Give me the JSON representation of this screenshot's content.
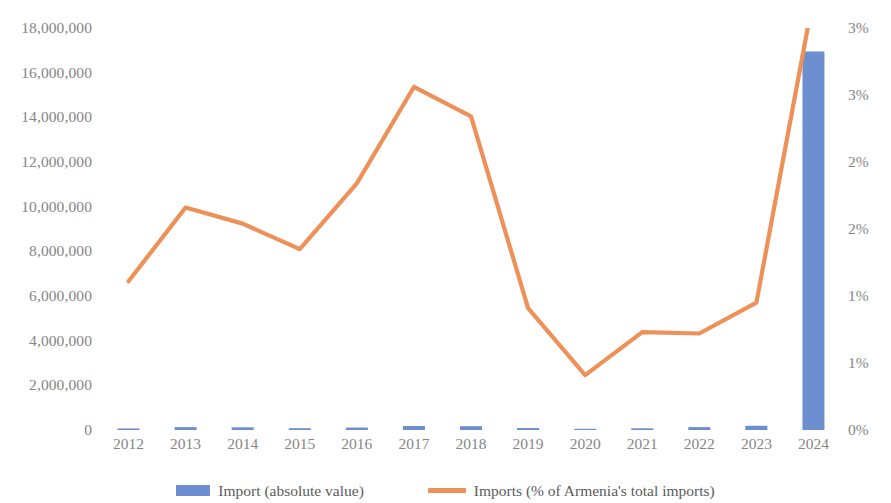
{
  "chart_data": {
    "type": "bar",
    "title": "",
    "subtitle": "",
    "xlabel": "",
    "ylabel": "",
    "categories": [
      "2012",
      "2013",
      "2014",
      "2015",
      "2016",
      "2017",
      "2018",
      "2019",
      "2020",
      "2021",
      "2022",
      "2023",
      "2024"
    ],
    "grid": false,
    "legend_position": "bottom",
    "y_axis_left": {
      "label": "",
      "ylim": [
        0,
        18000000
      ],
      "ticks": [
        0,
        2000000,
        4000000,
        6000000,
        8000000,
        10000000,
        12000000,
        14000000,
        16000000,
        18000000
      ],
      "tick_labels": [
        "0",
        "2,000,000",
        "4,000,000",
        "6,000,000",
        "8,000,000",
        "10,000,000",
        "12,000,000",
        "14,000,000",
        "16,000,000",
        "18,000,000"
      ]
    },
    "y_axis_right": {
      "label": "",
      "ylim": [
        0,
        3
      ],
      "ticks": [
        0,
        0.5,
        1,
        1.5,
        2,
        2.5,
        3
      ],
      "tick_labels": [
        "0%",
        "1%",
        "1%",
        "2%",
        "2%",
        "3%",
        "3%"
      ]
    },
    "series": [
      {
        "name": "Import (absolute value)",
        "type": "bar",
        "axis": "left",
        "color": "#6E8FCF",
        "values": [
          70000,
          130000,
          120000,
          80000,
          110000,
          180000,
          170000,
          90000,
          30000,
          75000,
          130000,
          190000,
          16950000
        ]
      },
      {
        "name": "Imports (% of Armenia's total imports)",
        "type": "line",
        "axis": "right",
        "color": "#EE9159",
        "values": [
          1.11,
          1.66,
          1.54,
          1.35,
          1.84,
          2.56,
          2.34,
          0.91,
          0.41,
          0.73,
          0.72,
          0.95,
          3.23
        ]
      }
    ]
  },
  "legend": {
    "items": [
      {
        "label": "Import (absolute value)",
        "marker": "bar-swatch",
        "color": "#6E8FCF"
      },
      {
        "label": "Imports (% of Armenia's total imports)",
        "marker": "line-swatch",
        "color": "#EE9159"
      }
    ]
  }
}
